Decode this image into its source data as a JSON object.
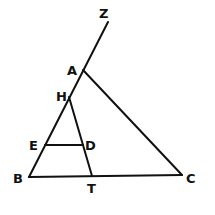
{
  "diagram": {
    "type": "geometry",
    "points": {
      "Z": "Z",
      "A": "A",
      "H": "H",
      "E": "E",
      "D": "D",
      "B": "B",
      "T": "T",
      "C": "C"
    },
    "segments": [
      "B-Z",
      "A-C",
      "B-C",
      "H-T",
      "E-D"
    ]
  }
}
